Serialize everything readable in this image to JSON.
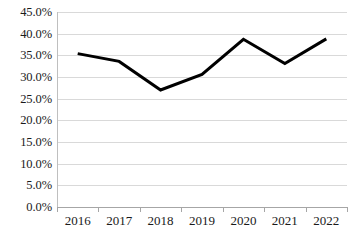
{
  "chart_data": {
    "type": "line",
    "title": "",
    "subtitle": "",
    "xlabel": "",
    "ylabel": "",
    "categories": [
      "2016",
      "2017",
      "2018",
      "2019",
      "2020",
      "2021",
      "2022"
    ],
    "values": [
      35.4,
      33.6,
      27.0,
      30.6,
      38.7,
      33.1,
      38.8
    ],
    "series": [
      {
        "name": "",
        "values": [
          35.4,
          33.6,
          27.0,
          30.6,
          38.7,
          33.1,
          38.8
        ]
      }
    ],
    "value_labels": [
      "35.4%",
      "33.6%",
      "27.0%",
      "30.6%",
      "38.7%",
      "33.1%",
      "38.8%"
    ],
    "ylim": [
      0,
      45
    ],
    "ytick_values": [
      0,
      5,
      10,
      15,
      20,
      25,
      30,
      35,
      40,
      45
    ],
    "ytick_labels": [
      "0.0%",
      "5.0%",
      "10.0%",
      "15.0%",
      "20.0%",
      "25.0%",
      "30.0%",
      "35.0%",
      "40.0%",
      "45.0%"
    ],
    "grid": true,
    "grid_axis": "y",
    "legend": false,
    "legend_position": "none",
    "markers": false,
    "line_color": "#000000",
    "line_width_px": 3,
    "gridline_color": "#d9d9d9",
    "axis_color": "#a6a6a6",
    "background_color": "#ffffff",
    "text_color": "#1a1a1a",
    "annotations": []
  }
}
